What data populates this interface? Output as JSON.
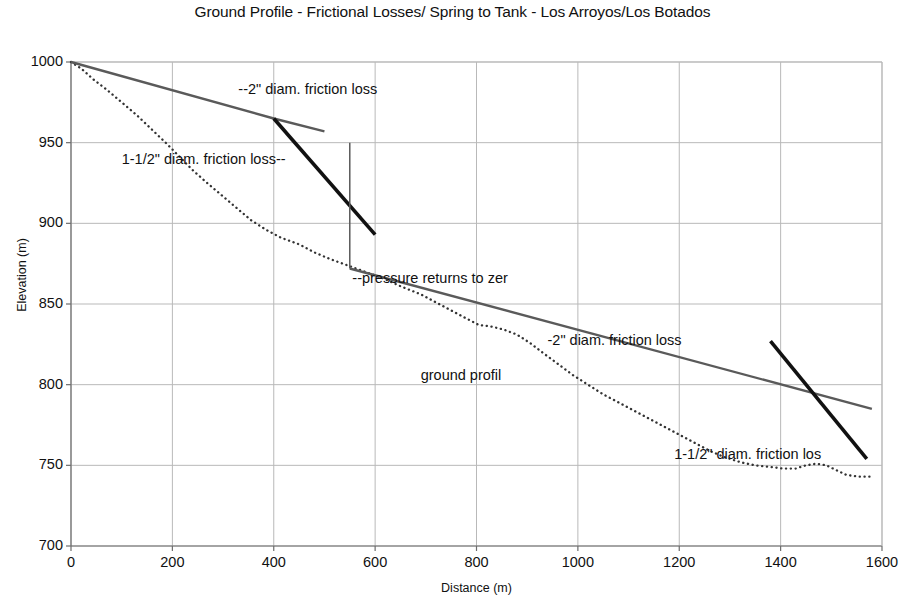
{
  "chart_data": {
    "type": "line",
    "title": "Ground Profile - Frictional Losses/ Spring to Tank - Los Arroyos/Los Botados",
    "xlabel": "Distance (m)",
    "ylabel": "Elevation (m)",
    "xlim": [
      0,
      1600
    ],
    "ylim": [
      700,
      1000
    ],
    "xticks": [
      0,
      200,
      400,
      600,
      800,
      1000,
      1200,
      1400,
      1600
    ],
    "yticks": [
      700,
      750,
      800,
      850,
      900,
      950,
      1000
    ],
    "grid": true,
    "legend_position": "none (inline annotations)",
    "series": [
      {
        "name": "ground profile",
        "style": "dotted",
        "color": "#333333",
        "points": [
          [
            0,
            1000
          ],
          [
            20,
            996
          ],
          [
            45,
            989
          ],
          [
            70,
            983
          ],
          [
            100,
            975
          ],
          [
            130,
            967
          ],
          [
            160,
            958
          ],
          [
            190,
            949
          ],
          [
            215,
            941
          ],
          [
            240,
            933
          ],
          [
            265,
            926
          ],
          [
            295,
            918
          ],
          [
            325,
            910
          ],
          [
            355,
            902
          ],
          [
            385,
            896
          ],
          [
            415,
            891
          ],
          [
            450,
            887
          ],
          [
            480,
            882
          ],
          [
            510,
            878
          ],
          [
            545,
            874
          ],
          [
            580,
            870
          ],
          [
            615,
            866
          ],
          [
            650,
            861
          ],
          [
            690,
            856
          ],
          [
            720,
            851
          ],
          [
            750,
            846
          ],
          [
            780,
            841
          ],
          [
            805,
            837
          ],
          [
            830,
            836
          ],
          [
            855,
            834
          ],
          [
            880,
            831
          ],
          [
            905,
            826
          ],
          [
            930,
            820
          ],
          [
            960,
            813
          ],
          [
            990,
            806
          ],
          [
            1020,
            800
          ],
          [
            1050,
            794
          ],
          [
            1080,
            789
          ],
          [
            1110,
            784
          ],
          [
            1140,
            779
          ],
          [
            1170,
            774
          ],
          [
            1200,
            769
          ],
          [
            1230,
            764
          ],
          [
            1260,
            759
          ],
          [
            1290,
            755
          ],
          [
            1320,
            752
          ],
          [
            1350,
            750
          ],
          [
            1380,
            749
          ],
          [
            1405,
            748
          ],
          [
            1430,
            748
          ],
          [
            1450,
            750
          ],
          [
            1470,
            751
          ],
          [
            1490,
            750
          ],
          [
            1510,
            747
          ],
          [
            1530,
            744
          ],
          [
            1555,
            743
          ],
          [
            1580,
            743
          ]
        ]
      },
      {
        "name": "2\" diam. friction loss (upper reach)",
        "style": "solid-gray",
        "color": "#5a5a5a",
        "points": [
          [
            0,
            1000
          ],
          [
            400,
            965
          ],
          [
            500,
            957
          ]
        ]
      },
      {
        "name": "1-1/2\" diam. friction loss (upper reach)",
        "style": "solid-black-heavy",
        "color": "#111111",
        "points": [
          [
            400,
            965
          ],
          [
            600,
            893
          ]
        ]
      },
      {
        "name": "pressure returns to zero (vertical drop)",
        "style": "solid-gray-thin",
        "color": "#5a5a5a",
        "points": [
          [
            550,
            950
          ],
          [
            550,
            872
          ]
        ]
      },
      {
        "name": "2\" diam. friction loss (lower reach)",
        "style": "solid-gray",
        "color": "#5a5a5a",
        "points": [
          [
            550,
            872
          ],
          [
            1580,
            785
          ]
        ]
      },
      {
        "name": "1-1/2\" diam. friction loss (lower reach)",
        "style": "solid-black-heavy",
        "color": "#111111",
        "points": [
          [
            1380,
            827
          ],
          [
            1570,
            754
          ]
        ]
      }
    ],
    "annotations": [
      {
        "id": "annot-2in-upper",
        "text": "--2\" diam. friction loss",
        "x": 330,
        "y": 983
      },
      {
        "id": "annot-1p5in-upper",
        "text": "1-1/2\" diam. friction loss--",
        "x": 100,
        "y": 940
      },
      {
        "id": "annot-pressure-zero",
        "text": "--pressure returns to zer",
        "x": 555,
        "y": 866
      },
      {
        "id": "annot-2in-lower",
        "text": "-2\" diam. friction loss",
        "x": 940,
        "y": 828
      },
      {
        "id": "annot-ground-profile",
        "text": "ground profil",
        "x": 690,
        "y": 806
      },
      {
        "id": "annot-1p5in-lower",
        "text": "1-1/2\" diam. friction los",
        "x": 1190,
        "y": 757
      }
    ]
  },
  "colors": {
    "gridline": "#b9b9b9",
    "axis": "#6d6d6d",
    "ground_profile": "#333333",
    "pipe_2in": "#5a5a5a",
    "pipe_1_5in": "#111111",
    "text": "#111111",
    "background": "#ffffff"
  }
}
